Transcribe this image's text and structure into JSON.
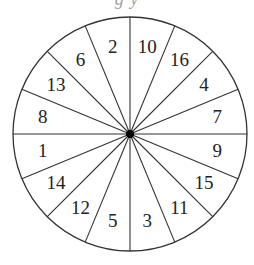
{
  "caption_clipped": "g y",
  "wheel": {
    "center": [
      130,
      134
    ],
    "radius": 117,
    "sector_count": 16,
    "stroke_color": "#333333",
    "hub_color": "#000000",
    "labels_clockwise_from_top": [
      "10",
      "16",
      "4",
      "7",
      "9",
      "15",
      "11",
      "3",
      "5",
      "12",
      "14",
      "1",
      "8",
      "13",
      "6",
      "2"
    ]
  }
}
